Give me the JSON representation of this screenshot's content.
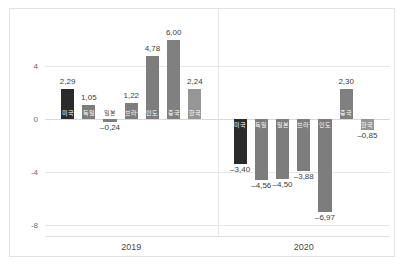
{
  "chart_data": {
    "type": "bar",
    "title": "",
    "subtitle": "",
    "xlabel": "",
    "ylabel": "",
    "grid": true,
    "legend": "none",
    "ylim": [
      -8.8,
      7.4
    ],
    "yticks": [
      "4",
      "0",
      "-4",
      "-8"
    ],
    "ytick_values": [
      4,
      0,
      -4,
      -8
    ],
    "categories": [
      "2019",
      "2020"
    ],
    "group_labels": [
      "2019",
      "2020"
    ],
    "groups": [
      {
        "name": "2019",
        "items": [
          {
            "label": "미국",
            "value": 2.29,
            "value_text": "2,29",
            "color": "#2b2b2b"
          },
          {
            "label": "독일",
            "value": 1.05,
            "value_text": "1,05",
            "color": "#7d7d7d"
          },
          {
            "label": "일본",
            "value": -0.24,
            "value_text": "–0,24",
            "color": "#7d7d7d"
          },
          {
            "label": "브라질",
            "value": 1.22,
            "value_text": "1,22",
            "color": "#7d7d7d"
          },
          {
            "label": "인도",
            "value": 4.78,
            "value_text": "4,78",
            "color": "#7d7d7d"
          },
          {
            "label": "중국",
            "value": 6.0,
            "value_text": "6,00",
            "color": "#808080"
          },
          {
            "label": "한국",
            "value": 2.24,
            "value_text": "2,24",
            "color": "#969696"
          }
        ]
      },
      {
        "name": "2020",
        "items": [
          {
            "label": "미국",
            "value": -3.4,
            "value_text": "–3,40",
            "color": "#2b2b2b"
          },
          {
            "label": "독일",
            "value": -4.56,
            "value_text": "–4,56",
            "color": "#7d7d7d"
          },
          {
            "label": "일본",
            "value": -4.5,
            "value_text": "–4,50",
            "color": "#7d7d7d"
          },
          {
            "label": "브라질",
            "value": -3.88,
            "value_text": "–3,88",
            "color": "#7d7d7d"
          },
          {
            "label": "인도",
            "value": -6.97,
            "value_text": "–6,97",
            "color": "#7d7d7d"
          },
          {
            "label": "중국",
            "value": 2.3,
            "value_text": "2,30",
            "color": "#808080"
          },
          {
            "label": "한국",
            "value": -0.85,
            "value_text": "–0,85",
            "color": "#969696"
          }
        ]
      }
    ]
  }
}
